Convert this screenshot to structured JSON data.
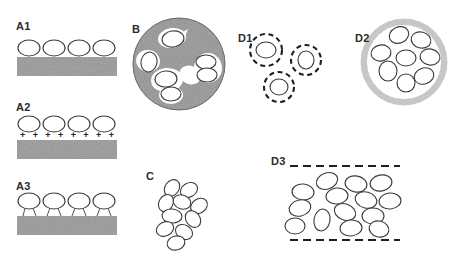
{
  "figure": {
    "width": 460,
    "height": 260,
    "background": "#ffffff",
    "stroke_color": "#3a3a3a",
    "substrate_fill": "#a8a8a8",
    "substrate_speckle": "#8f8f8f",
    "matrix_fill": "#a6a6a6",
    "ring_fill": "#d6d6d6",
    "dash_color": "#1f1f1f"
  },
  "panels": [
    {
      "id": "A1",
      "label": "A1",
      "caption": "vesicles resting on plain substrate",
      "label_pos": {
        "x": 16,
        "y": 20
      },
      "substrate": {
        "x": 17,
        "y": 57,
        "w": 100,
        "h": 19
      },
      "particles": [
        {
          "cx": 29,
          "cy": 48,
          "rx": 11,
          "ry": 8
        },
        {
          "cx": 54,
          "cy": 48,
          "rx": 11,
          "ry": 8
        },
        {
          "cx": 79,
          "cy": 48,
          "rx": 11,
          "ry": 8
        },
        {
          "cx": 104,
          "cy": 48,
          "rx": 11,
          "ry": 8
        }
      ]
    },
    {
      "id": "A2",
      "label": "A2",
      "caption": "vesicles bound to positively charged substrate",
      "label_pos": {
        "x": 16,
        "y": 101
      },
      "substrate": {
        "x": 17,
        "y": 140,
        "w": 100,
        "h": 19
      },
      "particles": [
        {
          "cx": 29,
          "cy": 124,
          "rx": 11,
          "ry": 8
        },
        {
          "cx": 54,
          "cy": 124,
          "rx": 11,
          "ry": 8
        },
        {
          "cx": 79,
          "cy": 124,
          "rx": 11,
          "ry": 8
        },
        {
          "cx": 104,
          "cy": 124,
          "rx": 11,
          "ry": 8
        }
      ],
      "charge_symbol": "+",
      "charge_count": 8,
      "charge_row": {
        "x": 20,
        "y": 131,
        "w": 94
      }
    },
    {
      "id": "A3",
      "label": "A3",
      "caption": "vesicles tethered to substrate by linkers",
      "label_pos": {
        "x": 16,
        "y": 180
      },
      "substrate": {
        "x": 17,
        "y": 216,
        "w": 100,
        "h": 19
      },
      "particles": [
        {
          "cx": 29,
          "cy": 201,
          "rx": 11,
          "ry": 8
        },
        {
          "cx": 54,
          "cy": 201,
          "rx": 11,
          "ry": 8
        },
        {
          "cx": 79,
          "cy": 201,
          "rx": 11,
          "ry": 8
        },
        {
          "cx": 104,
          "cy": 201,
          "rx": 11,
          "ry": 8
        }
      ],
      "tethers": [
        {
          "x1": 25,
          "y1": 208,
          "x2": 23,
          "y2": 216
        },
        {
          "x1": 33,
          "y1": 208,
          "x2": 36,
          "y2": 216
        },
        {
          "x1": 50,
          "y1": 208,
          "x2": 47,
          "y2": 216
        },
        {
          "x1": 58,
          "y1": 208,
          "x2": 61,
          "y2": 216
        },
        {
          "x1": 75,
          "y1": 208,
          "x2": 72,
          "y2": 216
        },
        {
          "x1": 83,
          "y1": 208,
          "x2": 86,
          "y2": 216
        },
        {
          "x1": 100,
          "y1": 208,
          "x2": 97,
          "y2": 216
        },
        {
          "x1": 108,
          "y1": 208,
          "x2": 111,
          "y2": 216
        }
      ]
    },
    {
      "id": "B",
      "label": "B",
      "caption": "vesicles embedded in a gel matrix sphere",
      "label_pos": {
        "x": 132,
        "y": 23
      },
      "matrix": {
        "cx": 179,
        "cy": 64,
        "r": 46
      },
      "pockets": [
        {
          "cx": 172,
          "cy": 38,
          "rx": 14,
          "ry": 10,
          "rot": -8
        },
        {
          "cx": 148,
          "cy": 61,
          "rx": 12,
          "ry": 11,
          "rot": 15
        },
        {
          "cx": 167,
          "cy": 80,
          "rx": 16,
          "ry": 12,
          "rot": -5
        },
        {
          "cx": 171,
          "cy": 95,
          "rx": 12,
          "ry": 9,
          "rot": 0
        },
        {
          "cx": 208,
          "cy": 68,
          "rx": 14,
          "ry": 15,
          "rot": 0
        },
        {
          "cx": 190,
          "cy": 75,
          "rx": 11,
          "ry": 9,
          "rot": 25
        }
      ],
      "particles": [
        {
          "cx": 173,
          "cy": 39,
          "rx": 11,
          "ry": 8,
          "rot": -8
        },
        {
          "cx": 149,
          "cy": 62,
          "rx": 8,
          "ry": 10,
          "rot": 12
        },
        {
          "cx": 166,
          "cy": 79,
          "rx": 11,
          "ry": 8,
          "rot": -4
        },
        {
          "cx": 171,
          "cy": 94,
          "rx": 10,
          "ry": 7,
          "rot": 0
        },
        {
          "cx": 206,
          "cy": 62,
          "rx": 10,
          "ry": 7,
          "rot": 0
        },
        {
          "cx": 207,
          "cy": 75,
          "rx": 10,
          "ry": 7,
          "rot": 0
        }
      ]
    },
    {
      "id": "C",
      "label": "C",
      "caption": "free vesicle aggregate",
      "label_pos": {
        "x": 146,
        "y": 170
      },
      "particles": [
        {
          "cx": 172,
          "cy": 188,
          "rx": 9,
          "ry": 7,
          "rot": -55
        },
        {
          "cx": 189,
          "cy": 190,
          "rx": 9,
          "ry": 7,
          "rot": -30
        },
        {
          "cx": 166,
          "cy": 203,
          "rx": 9,
          "ry": 7,
          "rot": -60
        },
        {
          "cx": 182,
          "cy": 202,
          "rx": 9,
          "ry": 7,
          "rot": 20
        },
        {
          "cx": 199,
          "cy": 206,
          "rx": 9,
          "ry": 7,
          "rot": -35
        },
        {
          "cx": 172,
          "cy": 216,
          "rx": 10,
          "ry": 7,
          "rot": 5
        },
        {
          "cx": 193,
          "cy": 219,
          "rx": 9,
          "ry": 7,
          "rot": 55
        },
        {
          "cx": 165,
          "cy": 229,
          "rx": 9,
          "ry": 7,
          "rot": -25
        },
        {
          "cx": 184,
          "cy": 232,
          "rx": 9,
          "ry": 7,
          "rot": 30
        },
        {
          "cx": 176,
          "cy": 243,
          "rx": 9,
          "ry": 7,
          "rot": -15
        }
      ]
    },
    {
      "id": "D1",
      "label": "D1",
      "caption": "individually encapsulated vesicles",
      "label_pos": {
        "x": 238,
        "y": 32
      },
      "capsules": [
        {
          "cx": 266,
          "cy": 50,
          "r": 16
        },
        {
          "cx": 306,
          "cy": 60,
          "r": 15
        },
        {
          "cx": 279,
          "cy": 87,
          "r": 15
        }
      ],
      "particles": [
        {
          "cx": 266,
          "cy": 50,
          "rx": 10,
          "ry": 8,
          "rot": 0
        },
        {
          "cx": 306,
          "cy": 60,
          "rx": 8,
          "ry": 9,
          "rot": 0
        },
        {
          "cx": 279,
          "cy": 87,
          "rx": 9,
          "ry": 8,
          "rot": 0
        }
      ]
    },
    {
      "id": "D2",
      "label": "D2",
      "caption": "vesicles co-encapsulated in one capsule",
      "label_pos": {
        "x": 355,
        "y": 32
      },
      "capsule": {
        "cx": 404,
        "cy": 62,
        "r": 43,
        "ring_width": 6
      },
      "particles": [
        {
          "cx": 399,
          "cy": 35,
          "rx": 10,
          "ry": 8,
          "rot": -25
        },
        {
          "cx": 421,
          "cy": 40,
          "rx": 10,
          "ry": 8,
          "rot": 15
        },
        {
          "cx": 381,
          "cy": 53,
          "rx": 10,
          "ry": 8,
          "rot": -10
        },
        {
          "cx": 406,
          "cy": 58,
          "rx": 10,
          "ry": 8,
          "rot": 0
        },
        {
          "cx": 430,
          "cy": 57,
          "rx": 10,
          "ry": 8,
          "rot": 10
        },
        {
          "cx": 388,
          "cy": 71,
          "rx": 9,
          "ry": 10,
          "rot": 0
        },
        {
          "cx": 424,
          "cy": 76,
          "rx": 10,
          "ry": 8,
          "rot": -20
        },
        {
          "cx": 406,
          "cy": 83,
          "rx": 9,
          "ry": 9,
          "rot": 0
        }
      ]
    },
    {
      "id": "D3",
      "label": "D3",
      "caption": "vesicles confined between two permeable membranes",
      "label_pos": {
        "x": 271,
        "y": 155
      },
      "boundaries": [
        {
          "x1": 290,
          "y1": 166,
          "x2": 400,
          "y2": 166
        },
        {
          "x1": 290,
          "y1": 240,
          "x2": 400,
          "y2": 240
        }
      ],
      "particles": [
        {
          "cx": 327,
          "cy": 181,
          "rx": 11,
          "ry": 8,
          "rot": -20
        },
        {
          "cx": 356,
          "cy": 184,
          "rx": 11,
          "ry": 8,
          "rot": 10
        },
        {
          "cx": 381,
          "cy": 183,
          "rx": 11,
          "ry": 8,
          "rot": -10
        },
        {
          "cx": 303,
          "cy": 192,
          "rx": 11,
          "ry": 8,
          "rot": 5
        },
        {
          "cx": 337,
          "cy": 196,
          "rx": 11,
          "ry": 8,
          "rot": -5
        },
        {
          "cx": 366,
          "cy": 200,
          "rx": 11,
          "ry": 8,
          "rot": 15
        },
        {
          "cx": 390,
          "cy": 201,
          "rx": 11,
          "ry": 8,
          "rot": -5
        },
        {
          "cx": 300,
          "cy": 208,
          "rx": 11,
          "ry": 8,
          "rot": -15
        },
        {
          "cx": 345,
          "cy": 212,
          "rx": 11,
          "ry": 8,
          "rot": 20
        },
        {
          "cx": 373,
          "cy": 216,
          "rx": 11,
          "ry": 8,
          "rot": 0
        },
        {
          "cx": 322,
          "cy": 220,
          "rx": 8,
          "ry": 11,
          "rot": 10
        },
        {
          "cx": 295,
          "cy": 226,
          "rx": 10,
          "ry": 8,
          "rot": 0
        },
        {
          "cx": 351,
          "cy": 228,
          "rx": 11,
          "ry": 8,
          "rot": -5
        },
        {
          "cx": 379,
          "cy": 229,
          "rx": 10,
          "ry": 8,
          "rot": 15
        }
      ]
    }
  ]
}
